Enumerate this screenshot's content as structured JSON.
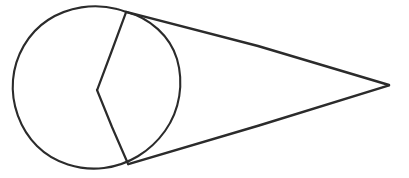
{
  "document": {
    "title": "Geometric Figure",
    "background_color": "#ffffff",
    "width": 409,
    "height": 178
  },
  "figure": {
    "name": "circle-with-tangent-lines-and-reflex-angle",
    "stroke_color": "#2b2b2b",
    "stroke_width": 2.1,
    "circle": {
      "label": "circle",
      "center_x": 100,
      "center_y": 89,
      "radius": 80
    },
    "points": [
      {
        "id": "top-tangency-point",
        "label": "upper tangency point",
        "x": 126,
        "y": 12
      },
      {
        "id": "bottom-tangency-point",
        "label": "lower tangency point",
        "x": 128,
        "y": 164
      },
      {
        "id": "apex-point",
        "label": "external apex",
        "x": 389,
        "y": 85
      },
      {
        "id": "interior-vertex",
        "label": "interior chord vertex",
        "x": 97,
        "y": 90
      }
    ],
    "segments": [
      {
        "id": "upper-tangent-line",
        "label": "upper tangent from tangency point to apex",
        "path": "M 126.2 11.8 L 258 46 L 389 85"
      },
      {
        "id": "lower-tangent-line",
        "label": "lower tangent from tangency point to apex",
        "path": "M 128.3 164.2 L 259 125.5 L 389 85.4"
      },
      {
        "id": "upper-chord",
        "label": "chord from upper tangency point to interior vertex",
        "path": "M 126.0 12.4 L 111 53 L 97.2 89.8"
      },
      {
        "id": "lower-chord",
        "label": "chord from interior vertex to lower tangency point",
        "path": "M 97.0 90.0 L 112 127 L 128.0 163.8"
      },
      {
        "id": "circle-outline",
        "label": "circle outline",
        "path": "M 126.2 12.0 C 150 18 170 36 177 59 C 184 83 180 110 165 131 C 150 152 128 165 104 168 C 80 171 54 163 37 146 C 20 129 11 104 13 80 C 15 56 28 33 48 20 C 68 7 94 3 117 9 C 120 9.7 123 10.8 126.2 12.0 Z"
      }
    ]
  }
}
